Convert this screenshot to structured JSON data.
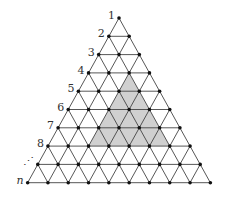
{
  "diagram": {
    "type": "triangular-lattice",
    "rows": 10,
    "apex": {
      "x": 119,
      "y": 18
    },
    "row_spacing": 18.3,
    "col_spacing": 20.3,
    "row_labels": [
      "1",
      "2",
      "3",
      "4",
      "5",
      "6",
      "7",
      "8",
      "⋰",
      "n"
    ],
    "shaded_region": {
      "apex_row": 4,
      "apex_index": 2,
      "size": 4,
      "fill": "#d0d0d0"
    },
    "colors": {
      "line": "#444444",
      "node": "#111111",
      "shade": "#d0d0d0"
    }
  }
}
